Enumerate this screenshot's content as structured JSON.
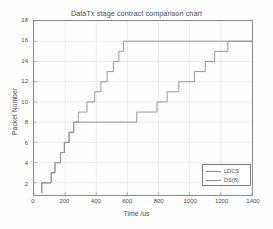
{
  "chart_data": {
    "type": "line",
    "title": "DataTx stage contract comparison chart",
    "xlabel": "Time /us",
    "ylabel": "Packet Number",
    "xlim": [
      0,
      1400
    ],
    "ylim": [
      0.8,
      18
    ],
    "xticks": [
      0,
      200,
      400,
      600,
      800,
      1000,
      1200,
      1400
    ],
    "yticks": [
      2,
      4,
      6,
      8,
      10,
      12,
      14,
      16,
      18
    ],
    "grid": true,
    "legend_position": "lower right",
    "line_style": "step-post",
    "series": [
      {
        "name": "LDCS",
        "color": "#8c8c8c",
        "x": [
          50,
          50,
          65,
          110,
          135,
          170,
          195,
          225,
          255,
          285,
          340,
          390,
          430,
          470,
          510,
          545,
          575,
          1400
        ],
        "y": [
          1,
          2,
          2,
          3,
          4,
          5,
          6,
          7,
          8,
          9,
          10,
          11,
          12,
          13,
          14,
          15,
          16,
          16
        ]
      },
      {
        "name": "DS(8)",
        "color": "#8c8c8c",
        "x": [
          50,
          50,
          80,
          110,
          135,
          170,
          195,
          225,
          255,
          285,
          660,
          790,
          855,
          930,
          1030,
          1100,
          1160,
          1245,
          1400
        ],
        "y": [
          1,
          2,
          2,
          3,
          4,
          5,
          6,
          7,
          8,
          8,
          9,
          10,
          11,
          12,
          13,
          14,
          15,
          16,
          16
        ]
      }
    ]
  },
  "legend": {
    "items": [
      {
        "label": "LDCS"
      },
      {
        "label": "DS(8)"
      }
    ]
  },
  "style": {
    "axis_color": "#8a8a8a",
    "grid_color": "#d8d8d8",
    "series_color": "#8c8c8c",
    "text_color": "#4a4a4a",
    "background": "#ffffff"
  }
}
